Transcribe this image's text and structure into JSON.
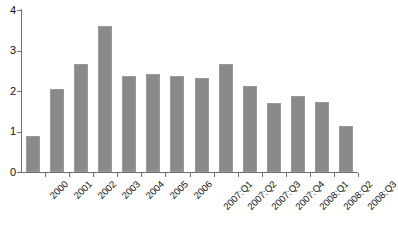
{
  "chart_data": {
    "type": "bar",
    "title": "",
    "subtitle": "",
    "xlabel": "",
    "ylabel": "",
    "categories": [
      "2000",
      "2001",
      "2002",
      "2003",
      "2004",
      "2005",
      "2006",
      "2007:Q1",
      "2007:Q2",
      "2007:Q3",
      "2007:Q4",
      "2008:Q1",
      "2008:Q2",
      "2008:Q3"
    ],
    "values": [
      0.89,
      2.05,
      2.67,
      3.6,
      2.37,
      2.42,
      2.36,
      2.31,
      2.67,
      2.13,
      1.71,
      1.88,
      1.72,
      1.14
    ],
    "ylim": [
      0,
      4
    ],
    "yticks": [
      0,
      1,
      2,
      3,
      4
    ],
    "ytick_labels": [
      "0",
      "1",
      "2",
      "3",
      "4"
    ],
    "grid": false,
    "legend": null,
    "legend_position": "none",
    "bar_color": "#8a8a8a",
    "axis_color": "#6e6e6e",
    "background_color": "#ffffff",
    "xtick_label_rotation": -45
  }
}
